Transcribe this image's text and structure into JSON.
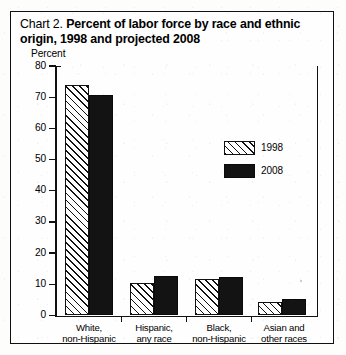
{
  "title": {
    "prefix": "Chart 2.",
    "main": "Percent of labor force by race and ethnic origin, 1998 and projected 2008"
  },
  "axis": {
    "y_axis_title": "Percent",
    "y_ticks": [
      "0",
      "10",
      "20",
      "30",
      "40",
      "50",
      "60",
      "70",
      "80"
    ]
  },
  "legend": {
    "entries": [
      {
        "label": "1998",
        "style": "hatch",
        "color": "#ffffff"
      },
      {
        "label": "2008",
        "style": "solid",
        "color": "#131313"
      }
    ]
  },
  "categories": [
    {
      "line1": "White,",
      "line2": "non-Hispanic"
    },
    {
      "line1": "Hispanic,",
      "line2": "any race"
    },
    {
      "line1": "Black,",
      "line2": "non-Hispanic"
    },
    {
      "line1": "Asian and",
      "line2": "other races"
    }
  ],
  "chart_data": {
    "type": "bar",
    "title": "Chart 2. Percent of labor force by race and ethnic origin, 1998 and projected 2008",
    "xlabel": "",
    "ylabel": "Percent",
    "ylim": [
      0,
      80
    ],
    "ytick_step": 10,
    "grid": false,
    "legend_position": "center-right",
    "categories": [
      "White, non-Hispanic",
      "Hispanic, any race",
      "Black, non-Hispanic",
      "Asian and other races"
    ],
    "series": [
      {
        "name": "1998",
        "values": [
          73.9,
          10.4,
          11.6,
          4.2
        ]
      },
      {
        "name": "2008",
        "values": [
          70.7,
          12.7,
          12.4,
          5.4
        ]
      }
    ]
  }
}
